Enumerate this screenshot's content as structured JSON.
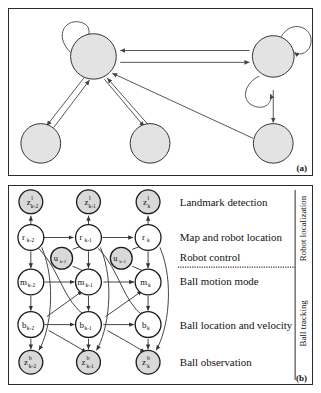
{
  "figure": {
    "panels": [
      {
        "id": "a",
        "tag": "(a)"
      },
      {
        "id": "b",
        "tag": "(b)"
      }
    ]
  },
  "panel_a": {
    "tag": "(a)",
    "node_fill": "#e3e3e3",
    "node_stroke": "#333333",
    "edge_color": "#555555",
    "nodes": [
      {
        "name": "node-top-left",
        "cx": 85,
        "cy": 57,
        "r": 23
      },
      {
        "name": "node-top-right",
        "cx": 271,
        "cy": 57,
        "r": 21
      },
      {
        "name": "node-bottom-left",
        "cx": 41,
        "cy": 144,
        "r": 20
      },
      {
        "name": "node-bottom-mid",
        "cx": 149,
        "cy": 144,
        "r": 20
      },
      {
        "name": "node-bottom-right",
        "cx": 271,
        "cy": 144,
        "r": 20
      }
    ],
    "self_loops": [
      {
        "name": "self-loop-top-left",
        "node": "node-top-left",
        "angle": 140
      },
      {
        "name": "self-loop-top-right-upper",
        "node": "node-top-right",
        "angle": 45
      },
      {
        "name": "self-loop-top-right-lower",
        "node": "node-top-right",
        "angle": 210
      }
    ],
    "edges": [
      {
        "name": "edge-right-to-left-upper",
        "from": "node-top-right",
        "to": "node-top-left"
      },
      {
        "name": "edge-left-to-right-lower",
        "from": "node-top-left",
        "to": "node-top-right"
      },
      {
        "name": "edge-left-to-bottomleft",
        "from": "node-top-left",
        "to": "node-bottom-left"
      },
      {
        "name": "edge-bottomleft-to-left",
        "from": "node-bottom-left",
        "to": "node-top-left"
      },
      {
        "name": "edge-left-to-bottommid",
        "from": "node-top-left",
        "to": "node-bottom-mid"
      },
      {
        "name": "edge-bottommid-to-left",
        "from": "node-bottom-mid",
        "to": "node-top-left"
      },
      {
        "name": "edge-bottomright-to-left",
        "from": "node-bottom-right",
        "to": "node-top-left"
      },
      {
        "name": "edge-topright-to-bottomright",
        "from": "node-top-right",
        "to": "node-bottom-right"
      }
    ]
  },
  "panel_b": {
    "tag": "(b)",
    "shaded_fill": "#d9d9d9",
    "clear_fill": "#ffffff",
    "node_stroke": "#1a1a1a",
    "edge_color": "#444444",
    "columns": [
      "k-2",
      "k-1",
      "k"
    ],
    "rows": [
      {
        "id": "zl",
        "label": "Landmark detection",
        "symbol": "z",
        "sup": "l",
        "shaded": true
      },
      {
        "id": "r",
        "label": "Map and robot location",
        "symbol": "r",
        "sup": "",
        "shaded": false
      },
      {
        "id": "u",
        "label": "Robot control",
        "symbol": "u",
        "sup": "",
        "shaded": true
      },
      {
        "id": "m",
        "label": "Ball motion mode",
        "symbol": "m",
        "sup": "",
        "shaded": false
      },
      {
        "id": "b",
        "label": "Ball location and velocity",
        "symbol": "b",
        "sup": "",
        "shaded": false
      },
      {
        "id": "zb",
        "label": "Ball observation",
        "symbol": "z",
        "sup": "b",
        "shaded": true
      }
    ],
    "nodes": [
      {
        "name": "node-zl-k-2",
        "symbol": "z",
        "sup": "l",
        "sub": "k-2",
        "cx": 30,
        "cy": 16,
        "r": 12,
        "shaded": true
      },
      {
        "name": "node-zl-k-1",
        "symbol": "z",
        "sup": "l",
        "sub": "k-1",
        "cx": 88,
        "cy": 16,
        "r": 12,
        "shaded": true
      },
      {
        "name": "node-zl-k",
        "symbol": "z",
        "sup": "l",
        "sub": "k",
        "cx": 148,
        "cy": 16,
        "r": 12,
        "shaded": true
      },
      {
        "name": "node-r-k-2",
        "symbol": "r",
        "sup": "",
        "sub": "k-2",
        "cx": 30,
        "cy": 52,
        "r": 13,
        "shaded": false
      },
      {
        "name": "node-r-k-1",
        "symbol": "r",
        "sup": "",
        "sub": "k-1",
        "cx": 88,
        "cy": 52,
        "r": 13,
        "shaded": false
      },
      {
        "name": "node-r-k",
        "symbol": "r",
        "sup": "",
        "sub": "k",
        "cx": 148,
        "cy": 52,
        "r": 13,
        "shaded": false
      },
      {
        "name": "node-u-k-2",
        "symbol": "u",
        "sup": "",
        "sub": "k-2",
        "cx": 60,
        "cy": 73,
        "r": 11,
        "shaded": true
      },
      {
        "name": "node-u-k-1",
        "symbol": "u",
        "sup": "",
        "sub": "k-1",
        "cx": 120,
        "cy": 73,
        "r": 11,
        "shaded": true
      },
      {
        "name": "node-m-k-2",
        "symbol": "m",
        "sup": "",
        "sub": "k-2",
        "cx": 30,
        "cy": 97,
        "r": 13,
        "shaded": false
      },
      {
        "name": "node-m-k-1",
        "symbol": "m",
        "sup": "",
        "sub": "k-1",
        "cx": 88,
        "cy": 97,
        "r": 13,
        "shaded": false
      },
      {
        "name": "node-m-k",
        "symbol": "m",
        "sup": "",
        "sub": "k",
        "cx": 148,
        "cy": 97,
        "r": 13,
        "shaded": false
      },
      {
        "name": "node-b-k-2",
        "symbol": "b",
        "sup": "",
        "sub": "k-2",
        "cx": 30,
        "cy": 140,
        "r": 13,
        "shaded": false
      },
      {
        "name": "node-b-k-1",
        "symbol": "b",
        "sup": "",
        "sub": "k-1",
        "cx": 88,
        "cy": 140,
        "r": 13,
        "shaded": false
      },
      {
        "name": "node-b-k",
        "symbol": "b",
        "sup": "",
        "sub": "k",
        "cx": 148,
        "cy": 140,
        "r": 13,
        "shaded": false
      },
      {
        "name": "node-zb-k-2",
        "symbol": "z",
        "sup": "b",
        "sub": "k-2",
        "cx": 30,
        "cy": 178,
        "r": 12,
        "shaded": true
      },
      {
        "name": "node-zb-k-1",
        "symbol": "z",
        "sup": "b",
        "sub": "k-1",
        "cx": 88,
        "cy": 178,
        "r": 12,
        "shaded": true
      },
      {
        "name": "node-zb-k",
        "symbol": "z",
        "sup": "b",
        "sub": "k",
        "cx": 148,
        "cy": 178,
        "r": 12,
        "shaded": true
      }
    ],
    "row_labels": [
      {
        "name": "row-label-landmark-detection",
        "text": "Landmark detection",
        "x": 180,
        "y": 196
      },
      {
        "name": "row-label-map-robot-location",
        "text": "Map and robot location",
        "x": 180,
        "y": 232
      },
      {
        "name": "row-label-robot-control",
        "text": "Robot control",
        "x": 180,
        "y": 253
      },
      {
        "name": "row-label-ball-motion-mode",
        "text": "Ball motion mode",
        "x": 180,
        "y": 277
      },
      {
        "name": "row-label-ball-location",
        "text": "Ball location and velocity",
        "x": 180,
        "y": 320
      },
      {
        "name": "row-label-ball-observation",
        "text": "Ball observation",
        "x": 180,
        "y": 358
      }
    ],
    "side_labels": [
      {
        "name": "side-label-robot-localization",
        "text": "Robot localization"
      },
      {
        "name": "side-label-ball-tracking",
        "text": "Ball tracking"
      }
    ],
    "divider": {
      "name": "section-divider",
      "style": "dotted"
    }
  }
}
